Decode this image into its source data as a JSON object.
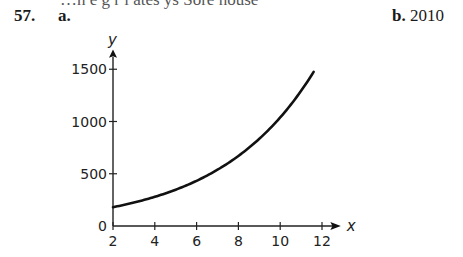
{
  "header": {
    "cutoff_text": "…n e g   r   l  ates ys  Sore house",
    "problem_number": "57.",
    "part_a_label": "a.",
    "part_b_label": "b.",
    "part_b_answer": "2010"
  },
  "chart_data": {
    "type": "line",
    "title": "",
    "xlabel": "x",
    "ylabel": "y",
    "xlim": [
      2,
      12.8
    ],
    "ylim": [
      0,
      1650
    ],
    "x_ticks": [
      2,
      4,
      6,
      8,
      10,
      12
    ],
    "y_ticks": [
      0,
      500,
      1000,
      1500
    ],
    "x_tick_labels": [
      "2",
      "4",
      "6",
      "8",
      "10",
      "12"
    ],
    "y_tick_labels": [
      "0",
      "500",
      "1000",
      "1500"
    ],
    "grid": false,
    "legend": null,
    "series": [
      {
        "name": "y",
        "x": [
          2,
          3,
          4,
          5,
          6,
          7,
          8,
          9,
          10,
          11,
          11.6
        ],
        "y": [
          180,
          224,
          279,
          347,
          432,
          538,
          670,
          834,
          1038,
          1292,
          1475
        ]
      }
    ]
  }
}
